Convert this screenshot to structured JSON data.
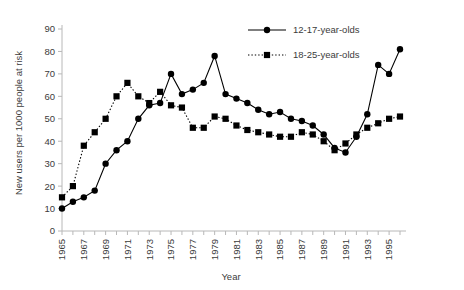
{
  "chart_data": {
    "type": "line",
    "title": "",
    "xlabel": "Year",
    "ylabel": "New users per 1000 people at risk",
    "xlim": [
      1965,
      1996
    ],
    "ylim": [
      0,
      90
    ],
    "ytick_step": 10,
    "yticks": [
      0,
      10,
      20,
      30,
      40,
      50,
      60,
      70,
      80,
      90
    ],
    "xticks": [
      1965,
      1966,
      1967,
      1968,
      1969,
      1970,
      1971,
      1972,
      1973,
      1974,
      1975,
      1976,
      1977,
      1978,
      1979,
      1980,
      1981,
      1982,
      1983,
      1984,
      1985,
      1986,
      1987,
      1988,
      1989,
      1990,
      1991,
      1992,
      1993,
      1994,
      1995,
      1996
    ],
    "xtick_labels": [
      "1965",
      "",
      "1967",
      "",
      "1969",
      "",
      "1971",
      "",
      "1973",
      "",
      "1975",
      "",
      "1977",
      "",
      "1979",
      "",
      "1981",
      "",
      "1983",
      "",
      "1985",
      "",
      "1987",
      "",
      "1989",
      "",
      "1991",
      "",
      "1993",
      "",
      "1995",
      ""
    ],
    "xtick_labels_rotated": "-90",
    "grid": "none",
    "legend_position": "top-right",
    "x": [
      1965,
      1966,
      1967,
      1968,
      1969,
      1970,
      1971,
      1972,
      1973,
      1974,
      1975,
      1976,
      1977,
      1978,
      1979,
      1980,
      1981,
      1982,
      1983,
      1984,
      1985,
      1986,
      1987,
      1988,
      1989,
      1990,
      1991,
      1992,
      1993,
      1994,
      1995,
      1996
    ],
    "series": [
      {
        "name": "12-17-year-olds",
        "marker": "circle",
        "linestyle": "solid",
        "color": "#000000",
        "values": [
          10,
          13,
          15,
          18,
          30,
          36,
          40,
          50,
          56,
          57,
          70,
          61,
          63,
          66,
          78,
          61,
          59,
          57,
          54,
          52,
          53,
          50,
          49,
          47,
          43,
          37,
          35,
          42,
          52,
          74,
          70,
          81
        ]
      },
      {
        "name": "18-25-year-olds",
        "marker": "square",
        "linestyle": "dotted",
        "color": "#000000",
        "values": [
          15,
          20,
          38,
          44,
          50,
          60,
          66,
          60,
          57,
          62,
          56,
          55,
          46,
          46,
          51,
          50,
          47,
          45,
          44,
          43,
          42,
          42,
          44,
          43,
          40,
          36,
          39,
          43,
          46,
          48,
          50,
          51
        ]
      }
    ]
  },
  "legend": {
    "items": [
      {
        "label": "12-17-year-olds",
        "marker": "circle",
        "linestyle": "solid"
      },
      {
        "label": "18-25-year-olds",
        "marker": "square",
        "linestyle": "dotted"
      }
    ]
  }
}
